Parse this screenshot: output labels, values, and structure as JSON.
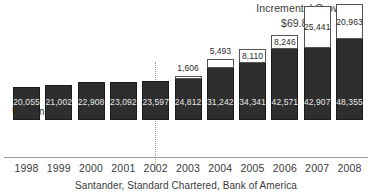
{
  "chart_data": {
    "type": "bar",
    "title": "Incremental Growth",
    "subtitle": "$69.87bn",
    "ylabel": "US$ million",
    "xlabel": "",
    "caption": "Santander, Standard Chartered, Bank of America",
    "categories": [
      "1998",
      "1999",
      "2000",
      "2001",
      "2002",
      "2003",
      "2004",
      "2005",
      "2006",
      "2007",
      "2008"
    ],
    "series": [
      {
        "name": "Base",
        "color": "#2e2e2e",
        "values": [
          20055,
          21002,
          22908,
          23092,
          23597,
          24812,
          31242,
          34341,
          42571,
          42907,
          48355
        ],
        "labels": [
          "20,055",
          "21,002",
          "22,908",
          "23,092",
          "23,597",
          "24,812",
          "31,242",
          "34,341",
          "42,571",
          "42,907",
          "48,355"
        ]
      },
      {
        "name": "Incremental Growth",
        "color": "#ffffff",
        "values": [
          null,
          null,
          null,
          null,
          null,
          1606,
          5493,
          8110,
          8246,
          25441,
          20963
        ],
        "labels": [
          "",
          "",
          "",
          "",
          "",
          "1,606",
          "5,493",
          "8,110",
          "8,246",
          "25,441",
          "20,963"
        ]
      }
    ],
    "ylim": [
      0,
      72000
    ],
    "grid": false,
    "legend_position": "none",
    "divider_after_category": "2002"
  },
  "axis": {
    "years": [
      "1998",
      "1999",
      "2000",
      "2001",
      "2002",
      "2003",
      "2004",
      "2005",
      "2006",
      "2007",
      "2008"
    ]
  },
  "bars": [
    {
      "year": "1998",
      "base_label": "20,055",
      "top_label": ""
    },
    {
      "year": "1999",
      "base_label": "21,002",
      "top_label": ""
    },
    {
      "year": "2000",
      "base_label": "22,908",
      "top_label": ""
    },
    {
      "year": "2001",
      "base_label": "23,092",
      "top_label": ""
    },
    {
      "year": "2002",
      "base_label": "23,597",
      "top_label": ""
    },
    {
      "year": "2003",
      "base_label": "24,812",
      "top_label": "1,606"
    },
    {
      "year": "2004",
      "base_label": "31,242",
      "top_label": "5,493"
    },
    {
      "year": "2005",
      "base_label": "34,341",
      "top_label": "8,110"
    },
    {
      "year": "2006",
      "base_label": "42,571",
      "top_label": "8,246"
    },
    {
      "year": "2007",
      "base_label": "42,907",
      "top_label": "25,441"
    },
    {
      "year": "2008",
      "base_label": "48,355",
      "top_label": "20,963"
    }
  ]
}
